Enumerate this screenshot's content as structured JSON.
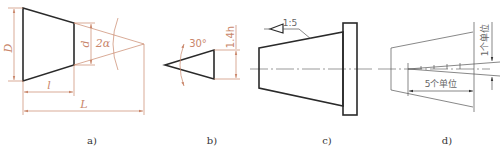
{
  "figure": {
    "panels": [
      {
        "id": "a",
        "caption": "a)",
        "labels": {
          "big_diameter": "D",
          "small_diameter": "d",
          "angle": "2α",
          "short_length": "l",
          "total_length": "L"
        }
      },
      {
        "id": "b",
        "caption": "b)",
        "labels": {
          "angle": "30°",
          "height": "1.4h"
        }
      },
      {
        "id": "c",
        "caption": "c)",
        "labels": {
          "taper_ratio": "1:5"
        }
      },
      {
        "id": "d",
        "caption": "d)",
        "labels": {
          "horizontal_units": "5个单位",
          "vertical_units": "1个单位"
        }
      }
    ],
    "colors": {
      "object_line": "#2a2a2a",
      "dimension_line": "#c9866a",
      "thin_line": "#555555"
    }
  }
}
